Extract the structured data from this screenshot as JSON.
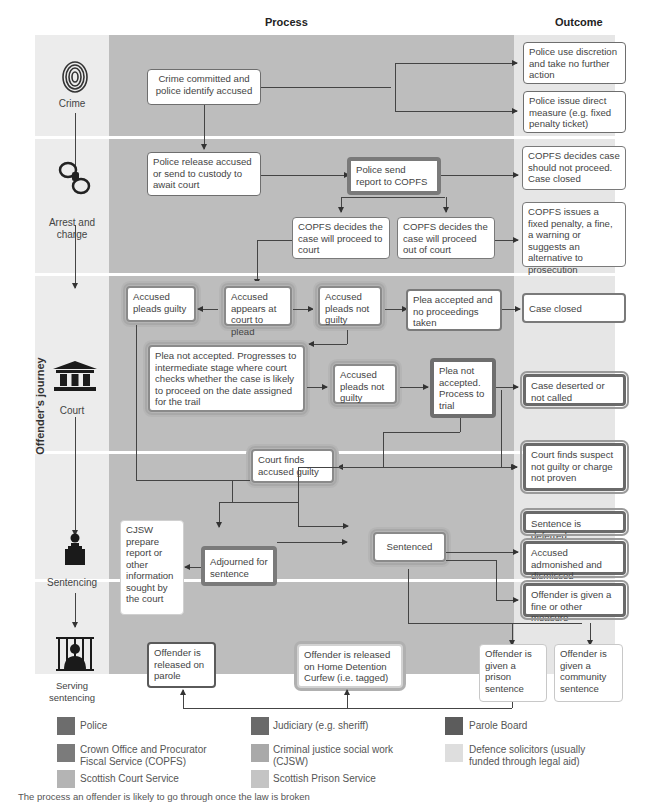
{
  "headers": {
    "process": "Process",
    "outcome": "Outcome"
  },
  "side_label": "Offender's journey",
  "stages": [
    {
      "label": "Crime",
      "icon": "fingerprint-icon"
    },
    {
      "label": "Arrest and charge",
      "icon": "handcuffs-icon"
    },
    {
      "label": "Court",
      "icon": "courthouse-icon"
    },
    {
      "label": "Sentencing",
      "icon": "judge-icon"
    },
    {
      "label": "Serving sentencing",
      "icon": "prison-bars-icon"
    }
  ],
  "boxes": {
    "crime_committed": "Crime committed and police identify accused",
    "police_discretion": "Police use discretion and take no further action",
    "police_direct_measure": "Police issue direct measure (e.g. fixed penalty ticket)",
    "police_release": "Police  release accused or send to custody to await court",
    "police_send_report": "Police send report to COPFS",
    "copfs_not_proceed": "COPFS decides case should not proceed. Case closed",
    "copfs_to_court": "COPFS decides the case will proceed to court",
    "copfs_out_of_court": "COPFS decides the case will proceed out of court",
    "copfs_fixed_penalty": "COPFS issues a fixed penalty, a fine, a warning or suggests an alternative to prosecution",
    "pleads_guilty": "Accused pleads guilty",
    "appears_to_plead": "Accused appears at court to plead",
    "pleads_not_guilty_1": "Accused pleads not guilty",
    "plea_accepted": "Plea accepted and no proceedings taken",
    "case_closed": "Case closed",
    "plea_not_accepted_intermediate": "Plea not accepted. Progresses to intermediate stage where court checks whether the case is likely to proceed on the date assigned for the trail",
    "pleads_not_guilty_2": "Accused pleads not guilty",
    "plea_not_accepted_trial": "Plea not accepted. Process to trial",
    "case_deserted": "Case deserted or not called",
    "court_finds_guilty": "Court finds accused guilty",
    "court_finds_not_guilty": "Court finds suspect not guilty or charge not proven",
    "cjsw_report": "CJSW prepare report or other information sought by the court",
    "adjourned": "Adjourned for sentence",
    "sentenced": "Sentenced",
    "sentence_deferred": "Sentence is deferred",
    "admonished": "Accused admonished and dismissed",
    "fine_other": "Offender is given a fine or other measure",
    "released_parole": "Offender is released on parole",
    "released_hdc": "Offender is released on Home Detention Curfew (i.e. tagged)",
    "prison_sentence": "Offender is given a prison sentence",
    "community_sentence": "Offender is given a community sentence"
  },
  "legend": [
    {
      "label": "Police",
      "color": "#6d6d6d"
    },
    {
      "label": "Judiciary (e.g. sheriff)",
      "color": "#6a6a6a"
    },
    {
      "label": "Parole Board",
      "color": "#5c5c5c"
    },
    {
      "label": "Crown Office and Procurator Fiscal Service (COPFS)",
      "color": "#7b7b7b"
    },
    {
      "label": "Criminal justice social work (CJSW)",
      "color": "#a9a9a9"
    },
    {
      "label": "Defence solicitors (usually funded through legal aid)",
      "color": "#dedede"
    },
    {
      "label": "Scottish Court Service",
      "color": "#b4b4b4"
    },
    {
      "label": "Scottish Prison Service",
      "color": "#c4c4c4"
    }
  ],
  "caption": "The process an offender is likely to go through once the law is broken"
}
